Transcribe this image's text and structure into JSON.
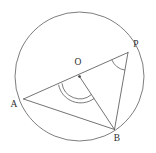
{
  "figure": {
    "kind": "circle-geometry-diagram",
    "background_color": "#ffffff",
    "stroke_color": "#5a5a5a",
    "circle_stroke_color": "#6e6e6e",
    "label_color": "#2e2e2e",
    "canvas": {
      "width": 156,
      "height": 153
    }
  },
  "circle": {
    "name": "main-circle",
    "center_x": 79.5,
    "center_y": 76.5,
    "radius": 64.5
  },
  "points": [
    {
      "id": "O",
      "label": "O",
      "x": 79.5,
      "y": 76.5,
      "label_x": 78,
      "label_y": 63,
      "has_dot": true
    },
    {
      "id": "A",
      "label": "A",
      "x": 23.5,
      "y": 99.0,
      "label_x": 14,
      "label_y": 105,
      "has_dot": false
    },
    {
      "id": "P",
      "label": "P",
      "x": 128.0,
      "y": 52.5,
      "label_x": 136,
      "label_y": 45,
      "has_dot": false
    },
    {
      "id": "B",
      "label": "B",
      "x": 114.5,
      "y": 129.5,
      "label_x": 117,
      "label_y": 139,
      "has_dot": false
    }
  ],
  "segments": [
    {
      "id": "AP",
      "name": "chord-a-to-p",
      "from": "A",
      "to": "P",
      "x1": 23.5,
      "y1": 99.0,
      "x2": 128.0,
      "y2": 52.5
    },
    {
      "id": "AB",
      "name": "chord-a-to-b",
      "from": "A",
      "to": "B",
      "x1": 23.5,
      "y1": 99.0,
      "x2": 114.5,
      "y2": 129.5
    },
    {
      "id": "OB",
      "name": "radius-o-to-b",
      "from": "O",
      "to": "B",
      "x1": 79.5,
      "y1": 76.5,
      "x2": 114.5,
      "y2": 129.5
    },
    {
      "id": "PB",
      "name": "chord-p-to-b",
      "from": "P",
      "to": "B",
      "x1": 128.0,
      "y1": 52.5,
      "x2": 114.5,
      "y2": 129.5
    }
  ],
  "angle_markers": [
    {
      "id": "angle-at-O",
      "name": "central-angle-arc",
      "vertex": "O",
      "style": "double-arc",
      "arc_paths": [
        "M 62.0 83.3 A 18.0 18.0 0 0 0 91.4 94.6",
        "M 58.6 84.7 A 22.5 22.5 0 0 0 94.3 98.3"
      ]
    },
    {
      "id": "angle-at-P",
      "name": "inscribed-angle-arc",
      "vertex": "P",
      "style": "single-arc",
      "arc_paths": [
        "M 111.8 59.8 A 17.6 17.6 0 0 0 124.9 70.1"
      ]
    }
  ],
  "labels": {
    "O": "O",
    "A": "A",
    "P": "P",
    "B": "B"
  }
}
